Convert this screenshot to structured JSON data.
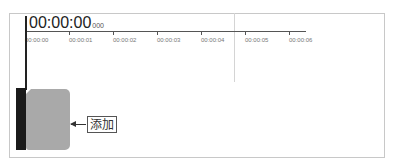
{
  "timeline": {
    "timecode": "00:00:00",
    "timecode_ms": "000",
    "ruler": {
      "ticks": [
        {
          "label": "00:00:00",
          "x": 25
        },
        {
          "label": "00:00:01",
          "x": 69
        },
        {
          "label": "00:00:02",
          "x": 113
        },
        {
          "label": "00:00:03",
          "x": 157
        },
        {
          "label": "00:00:04",
          "x": 201
        },
        {
          "label": "00:00:05",
          "x": 245
        },
        {
          "label": "00:00:06",
          "x": 289
        }
      ]
    },
    "annotation": {
      "label": "添加"
    },
    "colors": {
      "clip": "#a9a9a9",
      "track_bar": "#1a1a1a",
      "border": "#c8c8c8"
    }
  }
}
